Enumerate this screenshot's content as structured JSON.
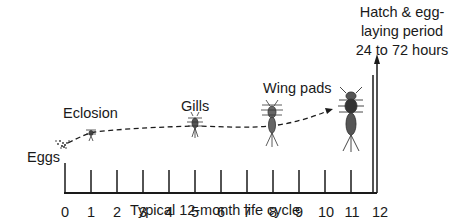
{
  "diagram": {
    "title": "Typical 12-month life cycle",
    "axis": {
      "ticks": [
        "0",
        "1",
        "2",
        "3",
        "4",
        "5",
        "6",
        "7",
        "8",
        "9",
        "10",
        "11",
        "12"
      ]
    },
    "stages": [
      {
        "label": "Eggs",
        "month": 0
      },
      {
        "label": "Eclosion",
        "month": 1
      },
      {
        "label": "Gills",
        "month": 5
      },
      {
        "label": "Wing pads",
        "month": 9
      }
    ],
    "hatch_note": {
      "line1": "Hatch & egg-",
      "line2": "laying period",
      "line3": "24 to 72 hours"
    },
    "colors": {
      "ink": "#1a1a1a",
      "background": "#ffffff"
    }
  }
}
